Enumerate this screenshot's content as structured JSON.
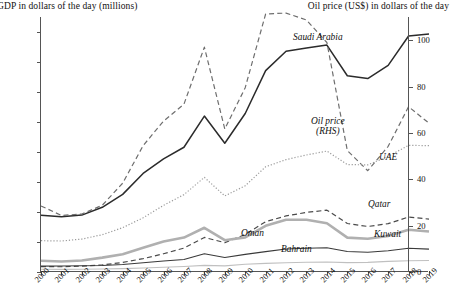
{
  "lhs_axis_title": "GDP in dollars of the day (millions)",
  "rhs_axis_title": "Oil price (US$) in dollars of the day",
  "y_left_ticks": [
    "800,000",
    "700,000",
    "600,000",
    "500,000",
    "400,000",
    "300,000",
    "200,000",
    "100,000",
    "0"
  ],
  "y_right_ticks": [
    "100",
    "80",
    "60",
    "40",
    "20",
    "0"
  ],
  "series_labels": {
    "saudi": "Saudi Arabia",
    "oil": "Oil price\n(RHS)",
    "oil_line1": "Oil price",
    "oil_line2": "(RHS)",
    "uae": "UAE",
    "qatar": "Qatar",
    "kuwait": "Kuwait",
    "oman": "Oman",
    "bahrain": "Bahrain"
  },
  "colors": {
    "axis": "#555555",
    "saudi": "#2b2b2b",
    "oil": "#6e6e6e",
    "uae": "#9a9a9a",
    "qatar": "#4a4a4a",
    "kuwait": "#b0b0b0",
    "oman": "#3a3a3a",
    "bahrain": "#c0c0c0"
  },
  "chart_data": {
    "type": "line",
    "title": "",
    "xlabel": "",
    "ylabel": "GDP in dollars of the day (millions)",
    "y2label": "Oil price (US$) in dollars of the day",
    "grid": false,
    "legend": "inline-annotations",
    "x": [
      2000,
      2001,
      2002,
      2003,
      2004,
      2005,
      2006,
      2007,
      2008,
      2009,
      2010,
      2011,
      2012,
      2013,
      2014,
      2015,
      2016,
      2017,
      2018,
      2019
    ],
    "xlim": [
      2000,
      2019
    ],
    "ylim": [
      0,
      850000
    ],
    "y2lim": [
      0,
      110
    ],
    "yticks": [
      0,
      100000,
      200000,
      300000,
      400000,
      500000,
      600000,
      700000,
      800000
    ],
    "y2ticks": [
      0,
      20,
      40,
      60,
      80,
      100
    ],
    "series": [
      {
        "name": "Saudi Arabia",
        "axis": "left",
        "style": "solid",
        "width": 1.5,
        "values": [
          189515,
          184000,
          189700,
          215800,
          258700,
          328500,
          376900,
          415900,
          519800,
          429100,
          528200,
          671200,
          735900,
          746600,
          756400,
          654300,
          644900,
          688600,
          786500,
          793000
        ]
      },
      {
        "name": "Oil price (RHS)",
        "axis": "right",
        "style": "dashed",
        "width": 1.2,
        "values": [
          28.5,
          24.4,
          25.0,
          28.8,
          38.3,
          54.5,
          65.1,
          72.4,
          97.0,
          61.7,
          79.5,
          111.3,
          111.7,
          108.7,
          99.0,
          52.4,
          43.7,
          54.2,
          71.3,
          64.2
        ]
      },
      {
        "name": "UAE",
        "axis": "left",
        "style": "dotted",
        "width": 1.2,
        "values": [
          104337,
          103312,
          109816,
          124346,
          147824,
          180617,
          222118,
          257916,
          315475,
          253546,
          287422,
          350666,
          374591,
          390108,
          403137,
          358135,
          357045,
          385606,
          422215,
          421142
        ]
      },
      {
        "name": "Qatar",
        "axis": "left",
        "style": "dashed",
        "width": 1.2,
        "values": [
          17760,
          17540,
          19360,
          23530,
          31730,
          44530,
          60880,
          79710,
          115270,
          97800,
          125120,
          167780,
          186830,
          198730,
          206220,
          161740,
          151730,
          161100,
          183340,
          176370
        ]
      },
      {
        "name": "Kuwait",
        "axis": "left",
        "style": "solid",
        "width": 2.6,
        "values": [
          37720,
          34890,
          38140,
          47880,
          59440,
          80800,
          101560,
          114720,
          147400,
          105910,
          115420,
          154020,
          174070,
          174160,
          162630,
          114670,
          110940,
          120130,
          140650,
          134760
        ]
      },
      {
        "name": "Oman",
        "axis": "left",
        "style": "solid",
        "width": 1.1,
        "values": [
          19450,
          19870,
          20720,
          21700,
          24760,
          31080,
          36800,
          41800,
          60910,
          48400,
          58640,
          67940,
          76880,
          78920,
          81080,
          68490,
          65700,
          70600,
          79300,
          76330
        ]
      },
      {
        "name": "Bahrain",
        "axis": "left",
        "style": "solid",
        "width": 1.1,
        "values": [
          9060,
          8730,
          9140,
          10000,
          11210,
          13370,
          15850,
          18480,
          22120,
          20550,
          25710,
          28780,
          30750,
          32540,
          33390,
          31130,
          32240,
          35470,
          37750,
          38570
        ]
      }
    ]
  }
}
